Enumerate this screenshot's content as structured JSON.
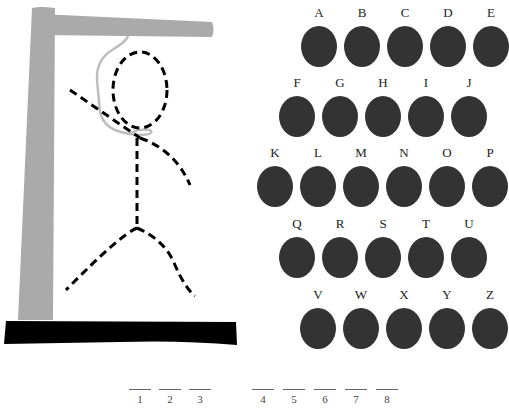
{
  "game": {
    "colors": {
      "gallows": "#aaaaaa",
      "rope": "#bdbdbd",
      "base": "#000000",
      "figure": "#000000",
      "disc": "#333333"
    }
  },
  "letters": [
    {
      "label": "A",
      "x": 301,
      "y": 4
    },
    {
      "label": "B",
      "x": 344,
      "y": 4
    },
    {
      "label": "C",
      "x": 387,
      "y": 4
    },
    {
      "label": "D",
      "x": 430,
      "y": 4
    },
    {
      "label": "E",
      "x": 473,
      "y": 4
    },
    {
      "label": "F",
      "x": 279,
      "y": 74
    },
    {
      "label": "G",
      "x": 322,
      "y": 74
    },
    {
      "label": "H",
      "x": 365,
      "y": 74
    },
    {
      "label": "I",
      "x": 408,
      "y": 74
    },
    {
      "label": "J",
      "x": 451,
      "y": 74
    },
    {
      "label": "K",
      "x": 257,
      "y": 144
    },
    {
      "label": "L",
      "x": 300,
      "y": 144
    },
    {
      "label": "M",
      "x": 343,
      "y": 144
    },
    {
      "label": "N",
      "x": 386,
      "y": 144
    },
    {
      "label": "O",
      "x": 429,
      "y": 144
    },
    {
      "label": "P",
      "x": 472,
      "y": 144
    },
    {
      "label": "Q",
      "x": 279,
      "y": 215
    },
    {
      "label": "R",
      "x": 322,
      "y": 215
    },
    {
      "label": "S",
      "x": 365,
      "y": 215
    },
    {
      "label": "T",
      "x": 408,
      "y": 215
    },
    {
      "label": "U",
      "x": 451,
      "y": 215
    },
    {
      "label": "V",
      "x": 300,
      "y": 286
    },
    {
      "label": "W",
      "x": 343,
      "y": 286
    },
    {
      "label": "X",
      "x": 386,
      "y": 286
    },
    {
      "label": "Y",
      "x": 429,
      "y": 286
    },
    {
      "label": "Z",
      "x": 472,
      "y": 286
    }
  ],
  "slots": [
    {
      "num": "1",
      "x": 129
    },
    {
      "num": "2",
      "x": 159
    },
    {
      "num": "3",
      "x": 189
    },
    {
      "num": "4",
      "x": 252
    },
    {
      "num": "5",
      "x": 283
    },
    {
      "num": "6",
      "x": 314
    },
    {
      "num": "7",
      "x": 345
    },
    {
      "num": "8",
      "x": 376
    }
  ]
}
